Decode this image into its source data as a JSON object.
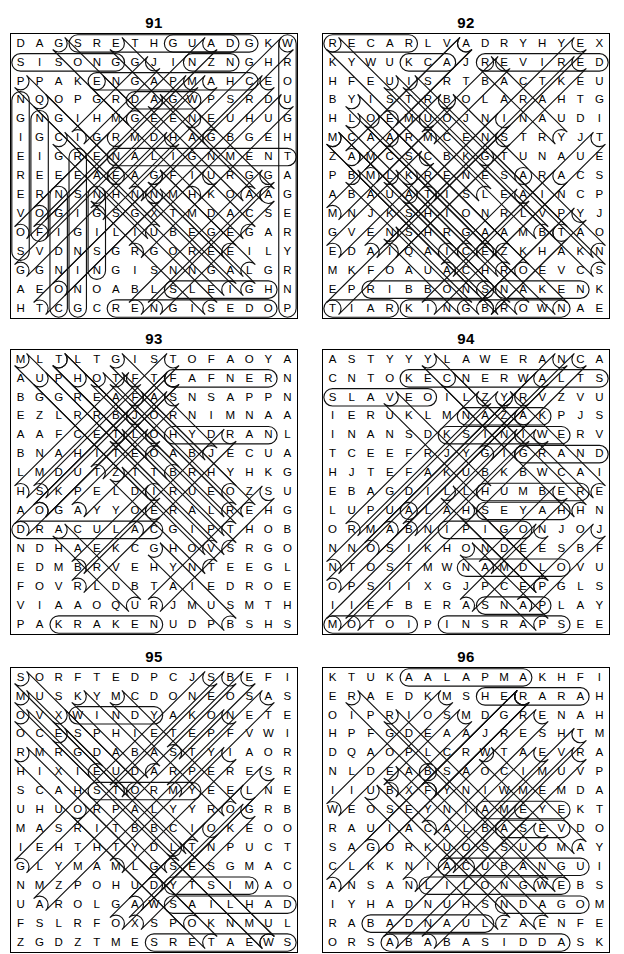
{
  "page": {
    "kind": "word-search-puzzle-solutions-page",
    "columns": 2,
    "rows": 3,
    "grid_size": 15
  },
  "puzzles": [
    {
      "number": "91",
      "rows": [
        "DAGSRETHGUADGKW",
        "SISONGGJINZNGHR",
        "PPAKENGAPMAHCEO",
        "NQOPGRDAGWPSRDU",
        "GNGIHMGEENEUHUG",
        "IGCIGRMDHAGBGEH",
        "EIGRENALIGNMENT",
        "REEEAEAGFIURGGA",
        "ERNSNHNNMHKOAAG",
        "VOGIGSGXTMDACSE",
        "OFIGILIUBEGEGAR",
        "SVDNSGRGOREEILY",
        "GGNINGISNNGALGR",
        "AEONOABLSLEIGHN",
        "HTCGCRENGISEDOP"
      ],
      "solutions": [
        {
          "word": "DAUGHTERS",
          "type": "horizontal-reverse",
          "row": 0,
          "col": 3,
          "len": 9
        },
        {
          "word": "GUAD",
          "type": "horizontal",
          "row": 0,
          "col": 8,
          "len": 5
        },
        {
          "word": "SISONG",
          "type": "horizontal",
          "row": 1,
          "col": 0,
          "len": 6
        },
        {
          "word": "INZN",
          "type": "horizontal",
          "row": 1,
          "col": 9,
          "len": 3
        },
        {
          "word": "CHAMPAGNE",
          "type": "horizontal-reverse",
          "row": 2,
          "col": 4,
          "len": 9
        },
        {
          "word": "DAGW",
          "type": "horizontal",
          "row": 3,
          "col": 6,
          "len": 4
        },
        {
          "word": "ALIGNMENT",
          "type": "horizontal",
          "row": 6,
          "col": 5,
          "len": 10
        },
        {
          "word": "SLEIGH",
          "type": "horizontal",
          "row": 13,
          "col": 8,
          "len": 6
        },
        {
          "word": "DESIGNER",
          "type": "horizontal-reverse",
          "row": 14,
          "col": 5,
          "len": 9
        },
        {
          "word": "NGIEREVOS",
          "type": "vertical",
          "row": 3,
          "col": 0,
          "len": 9
        },
        {
          "word": "NGIEROF",
          "type": "vertical",
          "row": 4,
          "col": 1,
          "len": 7
        },
        {
          "word": "NGIDN",
          "type": "vertical",
          "row": 8,
          "col": 2,
          "len": 7
        },
        {
          "word": "RESIGN",
          "type": "vertical",
          "row": 6,
          "col": 3,
          "len": 9
        },
        {
          "word": "NS",
          "type": "vertical",
          "row": 8,
          "col": 4,
          "len": 5
        },
        {
          "word": "WROUGHTAGERYRNP",
          "type": "vertical",
          "row": 0,
          "col": 14,
          "len": 15
        }
      ]
    },
    {
      "number": "92",
      "rows": [
        "RECARLVADRYHYEX",
        "KYWUKCAJREVIRED",
        "HFEUISRTBACTKEU",
        "BYISTRBOLARAHTG",
        "HLOEMUOJNINAUDI",
        "MCAARMCENSTRYJT",
        "ZAMCSCBKGTUNAUE",
        "PBMLKRENESARACS",
        "ABAUATISLEAINCP",
        "MNJKSHIONRLVPYJ",
        "GVENSHRGAAMBTAO",
        "EDAIQAICEZKHAKN",
        "MKFOAUACHROEVCS",
        "EPRIBBONSNAKENK",
        "TIARKINGBROWNAE"
      ],
      "solutions": [
        {
          "word": "RECAR",
          "type": "horizontal",
          "row": 0,
          "col": 0,
          "len": 5
        },
        {
          "word": "DERIVER",
          "type": "horizontal-reverse",
          "row": 1,
          "col": 8,
          "len": 7
        },
        {
          "word": "KCA",
          "type": "horizontal",
          "row": 1,
          "col": 4,
          "len": 3
        },
        {
          "word": "RIBBONS",
          "type": "horizontal",
          "row": 13,
          "col": 2,
          "len": 7
        },
        {
          "word": "SNAKE",
          "type": "horizontal",
          "row": 13,
          "col": 9,
          "len": 5
        },
        {
          "word": "KINGBROWN",
          "type": "horizontal",
          "row": 14,
          "col": 4,
          "len": 9
        },
        {
          "word": "TIAR",
          "type": "horizontal",
          "row": 14,
          "col": 0,
          "len": 4
        }
      ]
    },
    {
      "number": "93",
      "rows": [
        "MLTLTGISTOFAOYA",
        "AUPHOTFTFAFNERN",
        "BGGREAFASNSAPPN",
        "EZLRRBJORNIMNAA",
        "AAFCETLOHYDRANL",
        "BNAHITEOABJECUA",
        "LMDUTZTTBRHYHKG",
        "HSKPELDIRUEOZSU",
        "AOGAYYOERALREHG",
        "DRACULACGIPTHOB",
        "NDHAEKCGHOVSRGO",
        "EDMBRVEHYNTEEGL",
        "FOVRLDBTAIEDROE",
        "VIAAOQURJMUSMTH",
        "PAKRAKENUDPBSHS"
      ],
      "solutions": [
        {
          "word": "FAFNER",
          "type": "horizontal",
          "row": 1,
          "col": 8,
          "len": 6
        },
        {
          "word": "HYDRA",
          "type": "horizontal",
          "row": 4,
          "col": 8,
          "len": 6
        },
        {
          "word": "DRACULA",
          "type": "horizontal",
          "row": 9,
          "col": 0,
          "len": 8
        },
        {
          "word": "KRAKEN",
          "type": "horizontal",
          "row": 14,
          "col": 2,
          "len": 6
        }
      ]
    },
    {
      "number": "94",
      "rows": [
        "ASTYYYLAWERANCA",
        "CNTOKECNERWALTS",
        "SLAVEOILZYRVZVU",
        "IERUKLMNAZAKPJS",
        "INANSDKSINIWERV",
        "TCEEFRJYGIGRAND",
        "HJTEFAKUBKBWCAI",
        "EBAGDILLHUMBERE",
        "LUPUALAHSEYAHHN",
        "ORMABNIPIGONJOJ",
        "NNOSIKHONDEESBF",
        "NTOSTMWNAMDLOVU",
        "OPSIIXGJPCEPGLS",
        "IIEFBERASNAPLAY",
        "MOTOIPINSRAPSEE"
      ],
      "solutions": [
        {
          "word": "STLAWRENCE",
          "type": "horizontal-reverse",
          "row": 1,
          "col": 4,
          "len": 11
        },
        {
          "word": "SLAVE",
          "type": "horizontal",
          "row": 2,
          "col": 0,
          "len": 6
        },
        {
          "word": "NAZAK",
          "type": "horizontal",
          "row": 3,
          "col": 7,
          "len": 5
        },
        {
          "word": "KSINIW",
          "type": "horizontal",
          "row": 4,
          "col": 6,
          "len": 7
        },
        {
          "word": "GRAND",
          "type": "horizontal",
          "row": 5,
          "col": 10,
          "len": 5
        },
        {
          "word": "HUMBER",
          "type": "horizontal",
          "row": 7,
          "col": 8,
          "len": 6
        },
        {
          "word": "SEYAH",
          "type": "horizontal",
          "row": 8,
          "col": 8,
          "len": 5
        },
        {
          "word": "PIGON",
          "type": "horizontal",
          "row": 9,
          "col": 6,
          "len": 5
        },
        {
          "word": "NAMDL",
          "type": "horizontal",
          "row": 11,
          "col": 7,
          "len": 6
        },
        {
          "word": "SNAPLAY",
          "type": "horizontal",
          "row": 13,
          "col": 8,
          "len": 4
        },
        {
          "word": "PINSRAP",
          "type": "horizontal",
          "row": 14,
          "col": 6,
          "len": 7
        },
        {
          "word": "MOTOI",
          "type": "horizontal",
          "row": 14,
          "col": 0,
          "len": 5
        }
      ]
    },
    {
      "number": "95",
      "rows": [
        "SORFTEDPCJSBEFI",
        "MUSKYMCDONEOSAS",
        "OVXWINDYAKONETE",
        "OCESPHIETEPFVWI",
        "RMRGDABASTYIAOR",
        "HIXIEUDARPERESR",
        "SCAHSTORMYEELNE",
        "UHUORPALYYROGRB",
        "MASRITBBCIOKEOO",
        "IEHTHTYDLTNPUCT",
        "GLYMAMLGSESGMAC",
        "NMZPOHUDYTSIMAO",
        "UAROLGAWSAILHAD",
        "FSLRFOXSPOKNMUL",
        "ZGDZTMESRETAEWS"
      ],
      "solutions": [
        {
          "word": "WINDY",
          "type": "horizontal",
          "row": 2,
          "col": 3,
          "len": 5
        },
        {
          "word": "STORMY",
          "type": "horizontal",
          "row": 6,
          "col": 4,
          "len": 6
        },
        {
          "word": "MISTY",
          "type": "horizontal-reverse",
          "row": 11,
          "col": 8,
          "len": 5
        },
        {
          "word": "SAILHAD",
          "type": "horizontal",
          "row": 12,
          "col": 8,
          "len": 7
        },
        {
          "word": "SWEATERS",
          "type": "horizontal-reverse",
          "row": 14,
          "col": 7,
          "len": 8
        }
      ]
    },
    {
      "number": "96",
      "rows": [
        "KTUKAALAPMAKHFI",
        "ERAEDKMSHERARAH",
        "OIPRIOSMDGRENAH",
        "HPFGDEAAJRESHTM",
        "DQAOPLCRWTAEVRA",
        "NLDEABSAOCIMUVP",
        "IIUBXFYNIWMEMDA",
        "WEOSEYNIAMEYEKT",
        "RAUIACALBASEVDO",
        "SAGORKUOSSUOMAY",
        "CLKKNIACUBANGUI",
        "ANSANLILONGWEBS",
        "IYHADNUHSNDAGOM",
        "RABADNAULZAENFE",
        "ORSABABASIDDASK"
      ],
      "solutions": [
        {
          "word": "ALAPMAK",
          "type": "horizontal",
          "row": 0,
          "col": 4,
          "len": 7
        },
        {
          "word": "HERARA",
          "type": "horizontal",
          "row": 1,
          "col": 8,
          "len": 6
        },
        {
          "word": "AMEYE",
          "type": "horizontal",
          "row": 7,
          "col": 8,
          "len": 5
        },
        {
          "word": "BASE",
          "type": "horizontal",
          "row": 8,
          "col": 9,
          "len": 4
        },
        {
          "word": "CUBANGUI",
          "type": "horizontal",
          "row": 10,
          "col": 6,
          "len": 8
        },
        {
          "word": "LILONGWE",
          "type": "horizontal",
          "row": 11,
          "col": 5,
          "len": 8
        },
        {
          "word": "NDAGOM",
          "type": "horizontal",
          "row": 12,
          "col": 9,
          "len": 5
        },
        {
          "word": "BADNAUL",
          "type": "horizontal",
          "row": 13,
          "col": 2,
          "len": 7
        },
        {
          "word": "ABABASIDDA",
          "type": "horizontal",
          "row": 14,
          "col": 3,
          "len": 10
        }
      ]
    }
  ],
  "style": {
    "ink": "#000000",
    "paper": "#ffffff",
    "ring_stroke": "#111111"
  }
}
